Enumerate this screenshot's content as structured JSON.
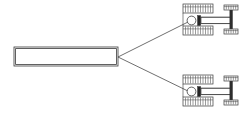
{
  "canvas": {
    "width": 250,
    "height": 118,
    "background": "#ffffff",
    "title": "Mechanism schematic: beam driving two mirrored actuator assemblies"
  },
  "style": {
    "line_color": "#3a3a3a",
    "hatch_color": "#4a4a4a",
    "dark_fill": "#242424",
    "fill_color": "#ffffff",
    "fan_color": "#4a4a4a"
  },
  "beam": {
    "label": "main-beam",
    "x": 14,
    "y": 47,
    "width": 104,
    "height": 19,
    "inner_inset": 1.6
  },
  "fan": {
    "origin_x": 118,
    "origin_y": 57,
    "targets": [
      {
        "x": 190,
        "y": 21
      },
      {
        "x": 190,
        "y": 92
      }
    ]
  },
  "assemblies": [
    {
      "name": "upper-assembly",
      "offset_y": 0,
      "ground_top": {
        "x": 183,
        "y": 4,
        "width": 30,
        "height": 9,
        "ticks": 11
      },
      "ground_bottom": {
        "x": 183,
        "y": 26,
        "width": 30,
        "height": 9,
        "ticks": 11
      },
      "pivot": {
        "cx": 191.5,
        "cy": 20.5,
        "r": 4.4
      },
      "dark_element": {
        "x": 197.5,
        "y": 15.5,
        "width": 3.2,
        "height": 10
      },
      "link_bar": {
        "x": 201,
        "y": 17.2,
        "width": 30,
        "height": 6.4
      },
      "post": {
        "x": 230,
        "y": 8,
        "width": 2.2,
        "height": 25
      },
      "pad_top": {
        "x": 224,
        "y": 5,
        "width": 14,
        "height": 5,
        "ticks": 5
      },
      "pad_bottom": {
        "x": 224,
        "y": 29,
        "width": 14,
        "height": 5,
        "ticks": 5
      },
      "rails": [
        {
          "x1": 201,
          "y1": 17.2,
          "x2": 231,
          "y2": 17.2
        },
        {
          "x1": 201,
          "y1": 23.6,
          "x2": 231,
          "y2": 23.6
        }
      ]
    },
    {
      "name": "lower-assembly",
      "offset_y": 71,
      "ground_top": {
        "x": 183,
        "y": 4,
        "width": 30,
        "height": 9,
        "ticks": 11
      },
      "ground_bottom": {
        "x": 183,
        "y": 26,
        "width": 30,
        "height": 9,
        "ticks": 11
      },
      "pivot": {
        "cx": 191.5,
        "cy": 20.5,
        "r": 4.4
      },
      "dark_element": {
        "x": 197.5,
        "y": 15.5,
        "width": 3.2,
        "height": 10
      },
      "link_bar": {
        "x": 201,
        "y": 17.2,
        "width": 30,
        "height": 6.4
      },
      "post": {
        "x": 230,
        "y": 8,
        "width": 2.2,
        "height": 25
      },
      "pad_top": {
        "x": 224,
        "y": 5,
        "width": 14,
        "height": 5,
        "ticks": 5
      },
      "pad_bottom": {
        "x": 224,
        "y": 29,
        "width": 14,
        "height": 5,
        "ticks": 5
      },
      "rails": [
        {
          "x1": 201,
          "y1": 17.2,
          "x2": 231,
          "y2": 17.2
        },
        {
          "x1": 201,
          "y1": 23.6,
          "x2": 231,
          "y2": 23.6
        }
      ]
    }
  ]
}
